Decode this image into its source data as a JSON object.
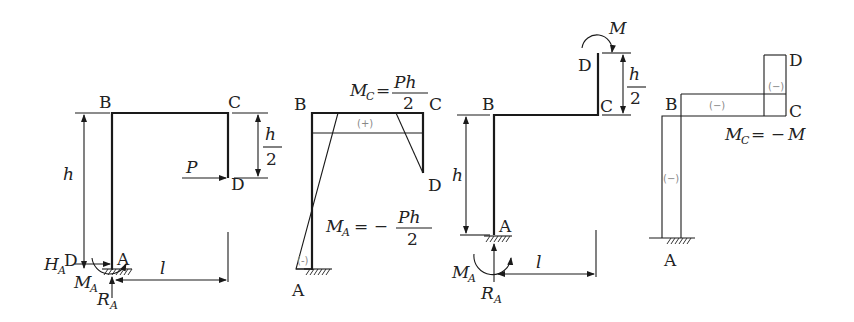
{
  "figure": {
    "panels": [
      {
        "id": "frame-load-P",
        "points": {
          "A": "A",
          "B": "B",
          "C": "C",
          "D": "D",
          "D2": "D"
        },
        "load": "P",
        "dims": {
          "h": "h",
          "half_num": "h",
          "half_den": "2",
          "l": "l"
        },
        "reactions": {
          "H": "H",
          "H_sub": "A",
          "M": "M",
          "M_sub": "A",
          "R": "R",
          "R_sub": "A"
        }
      },
      {
        "id": "moment-diagram-P",
        "points": {
          "A": "A",
          "B": "B",
          "C": "C",
          "D": "D"
        },
        "signs": {
          "top": "(+)",
          "left": "(-)"
        },
        "mc": {
          "M": "M",
          "sub": "C",
          "eq": "=",
          "num": "Ph",
          "den": "2"
        },
        "ma": {
          "M": "M",
          "sub": "A",
          "eq": "= −",
          "num": "Ph",
          "den": "2"
        }
      },
      {
        "id": "frame-load-M",
        "points": {
          "A": "A",
          "B": "B",
          "C": "C",
          "D": "D"
        },
        "load": "M",
        "dims": {
          "h": "h",
          "half_num": "h",
          "half_den": "2",
          "l": "l"
        },
        "reactions": {
          "M": "M",
          "M_sub": "A",
          "R": "R",
          "R_sub": "A"
        }
      },
      {
        "id": "moment-diagram-M",
        "points": {
          "A": "A",
          "B": "B",
          "C": "C",
          "D": "D"
        },
        "signs": {
          "top": "(−)",
          "cd": "(−)",
          "left": "(−)"
        },
        "mc": {
          "M": "M",
          "sub": "C",
          "eq": "= −",
          "rhs": "M"
        }
      }
    ]
  }
}
